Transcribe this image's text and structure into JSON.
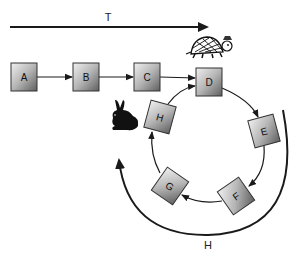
{
  "title_arrow": {
    "label": "T"
  },
  "bottom_arc": {
    "label": "H"
  },
  "nodes": [
    {
      "id": "A",
      "label": "A"
    },
    {
      "id": "B",
      "label": "B"
    },
    {
      "id": "C",
      "label": "C"
    },
    {
      "id": "D",
      "label": "D"
    },
    {
      "id": "E",
      "label": "E"
    },
    {
      "id": "F",
      "label": "F"
    },
    {
      "id": "G",
      "label": "G"
    },
    {
      "id": "H",
      "label": "H"
    }
  ],
  "characters": {
    "tortoise": "tortoise-icon",
    "hare": "hare-icon"
  },
  "colors": {
    "node_light": "#e8e8e8",
    "node_dark": "#6e6e6e",
    "line": "#1a1a1a"
  }
}
